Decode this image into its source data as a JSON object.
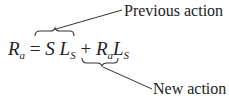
{
  "labels": {
    "previous_action": "Previous action",
    "new_action": "New action"
  },
  "equation": {
    "lhs_symbol": "R",
    "lhs_sub": "a",
    "equals": "=",
    "term1_a": "S",
    "term1_b": "L",
    "term1_b_sub": "S",
    "plus": "+",
    "term2_a": "R",
    "term2_a_sub": "a",
    "term2_b": "L",
    "term2_b_sub": "S"
  },
  "colors": {
    "ink": "#222222",
    "background": "#ffffff"
  }
}
